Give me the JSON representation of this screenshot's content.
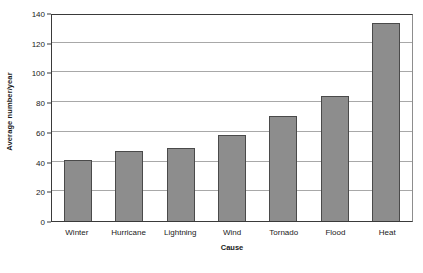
{
  "chart_data": {
    "type": "bar",
    "title": "",
    "subtitle": "",
    "xlabel": "Cause",
    "ylabel": "Average number/year",
    "categories": [
      "Winter",
      "Hurricane",
      "Lightning",
      "Wind",
      "Tornado",
      "Flood",
      "Heat"
    ],
    "values": [
      41,
      47,
      49,
      58,
      71,
      84,
      133
    ],
    "series": [
      {
        "name": "Average number/year",
        "values": [
          41,
          47,
          49,
          58,
          71,
          84,
          133
        ]
      }
    ],
    "ylim": [
      0,
      140
    ],
    "yticks": [
      0,
      20,
      40,
      60,
      80,
      100,
      120,
      140
    ],
    "ytick_labels": [
      "0",
      "20",
      "40",
      "60",
      "80",
      "100",
      "120",
      "140"
    ],
    "grid": "horizontal",
    "legend": "none",
    "bar_color": "#8d8d8d",
    "bar_edge_color": "#4a4a4a",
    "gridline_color": "#a8a8a8",
    "axis_color": "#3a3a3a",
    "background_color": "#ffffff",
    "annotations": []
  }
}
